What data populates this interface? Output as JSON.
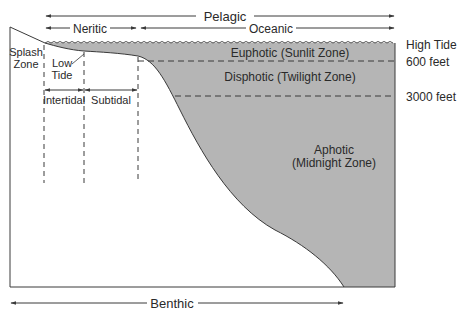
{
  "colors": {
    "water": "#b5b5b5",
    "line": "#3a3a3a",
    "background": "#ffffff"
  },
  "horizontal_zones": {
    "pelagic": "Pelagic",
    "neritic": "Neritic",
    "oceanic": "Oceanic",
    "benthic": "Benthic"
  },
  "shore_zones": {
    "splash_line1": "Splash",
    "splash_line2": "Zone",
    "low_tide_line1": "Low",
    "low_tide_line2": "Tide",
    "intertidal": "Intertidal",
    "subtidal": "Subtidal"
  },
  "depth_zones": {
    "euphotic": "Euphotic (Sunlit Zone)",
    "disphotic": "Disphotic (Twilight Zone)",
    "aphotic_line1": "Aphotic",
    "aphotic_line2": "(Midnight Zone)"
  },
  "depth_markers": {
    "high_tide": "High Tide",
    "depth_600": "600 feet",
    "depth_3000": "3000 feet"
  }
}
